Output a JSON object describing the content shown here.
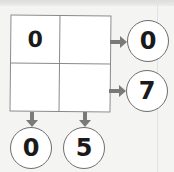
{
  "puzzle": {
    "grid": [
      [
        "0",
        ""
      ],
      [
        "",
        ""
      ]
    ],
    "row_outputs": [
      "0",
      "7"
    ],
    "column_outputs": [
      "0",
      "5"
    ]
  },
  "colors": {
    "background": "#f4f4f3",
    "arrow": "#7a7a7a",
    "border": "#8a8a8a",
    "text": "#1a1a1a"
  }
}
